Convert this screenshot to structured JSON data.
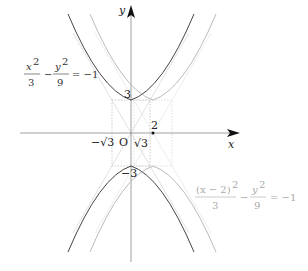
{
  "diagram": {
    "axes": {
      "x_label": "x",
      "y_label": "y",
      "origin_label": "O"
    },
    "tick_labels": {
      "neg_sqrt3": "−√3",
      "sqrt3": "√3",
      "two": "2",
      "y_top": "3",
      "y_bottom": "−3"
    },
    "curves": [
      {
        "name": "original-hyperbola",
        "equation_num1": "x",
        "equation_sup1": "2",
        "equation_den1": "3",
        "equation_op": "−",
        "equation_num2": "y",
        "equation_sup2": "2",
        "equation_den2": "9",
        "equation_rhs": "= −1",
        "color": "#444444"
      },
      {
        "name": "shifted-hyperbola",
        "equation_num1": "(x − 2)",
        "equation_sup1": "2",
        "equation_den1": "3",
        "equation_op": "−",
        "equation_num2": "y",
        "equation_sup2": "2",
        "equation_den2": "9",
        "equation_rhs": "= −1",
        "color": "#bbbbbb"
      }
    ],
    "colors": {
      "axis": "#888888",
      "dashed": "#aaaaaa",
      "main_curve": "#444444",
      "shifted_curve": "#bbbbbb"
    }
  }
}
